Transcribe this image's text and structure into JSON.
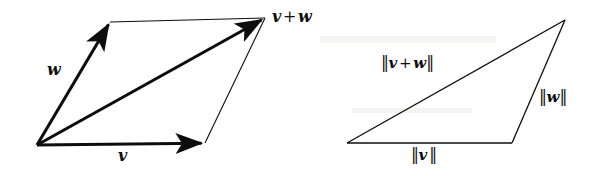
{
  "figure": {
    "type": "vector-addition-diagram",
    "background_color": "#ffffff",
    "stroke_color": "#0d0d0d",
    "panels": [
      {
        "id": "parallelogram",
        "name": "Parallelogram law of vector addition",
        "vertices": {
          "origin": [
            37,
            145
          ],
          "w_tip": [
            110,
            22
          ],
          "v_tip": [
            205,
            143
          ],
          "sum_tip": [
            265,
            18
          ]
        },
        "arrows": [
          {
            "name": "vector-w",
            "from": [
              37,
              145
            ],
            "to": [
              110,
              22
            ],
            "label": "w"
          },
          {
            "name": "vector-v",
            "from": [
              37,
              145
            ],
            "to": [
              205,
              143
            ],
            "label": "v"
          },
          {
            "name": "vector-v-plus-w",
            "from": [
              37,
              145
            ],
            "to": [
              265,
              18
            ],
            "label": "v + w"
          }
        ],
        "thin_sides": [
          {
            "name": "side-top",
            "from": [
              110,
              22
            ],
            "to": [
              265,
              18
            ]
          },
          {
            "name": "side-right",
            "from": [
              205,
              143
            ],
            "to": [
              265,
              18
            ]
          }
        ],
        "labels": {
          "w": "w",
          "v": "v",
          "sum_left": "v",
          "sum_op": "+",
          "sum_right": "w"
        }
      },
      {
        "id": "triangle",
        "name": "Triangle inequality diagram",
        "vertices": {
          "left": [
            347,
            143
          ],
          "bottom_right": [
            512,
            143
          ],
          "apex": [
            565,
            20
          ]
        },
        "thin_sides": [
          {
            "name": "side-base",
            "from": [
              347,
              143
            ],
            "to": [
              512,
              143
            ]
          },
          {
            "name": "side-hypotenuse",
            "from": [
              347,
              143
            ],
            "to": [
              565,
              20
            ]
          },
          {
            "name": "side-right",
            "from": [
              512,
              143
            ],
            "to": [
              565,
              20
            ]
          }
        ],
        "labels": {
          "norm_sum_left": "v",
          "norm_sum_op": "+",
          "norm_sum_right": "w",
          "norm_w": "w",
          "norm_v": "v",
          "bar": "‖"
        }
      }
    ]
  }
}
